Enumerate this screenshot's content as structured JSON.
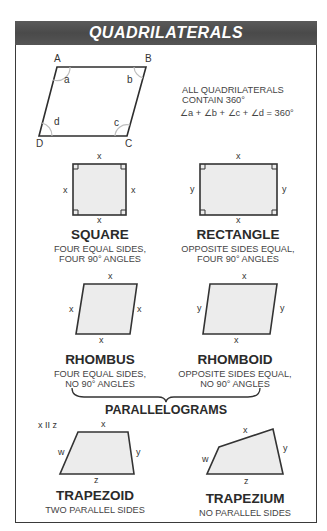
{
  "header": {
    "title": "QUADRILATERALS"
  },
  "general": {
    "vertices": [
      "A",
      "B",
      "C",
      "D"
    ],
    "angles": [
      "a",
      "b",
      "c",
      "d"
    ],
    "note_line1": "ALL QUADRILATERALS",
    "note_line2": "CONTAIN 360°",
    "formula": "∠a + ∠b + ∠c + ∠d = 360°"
  },
  "shapes": {
    "square": {
      "name": "SQUARE",
      "desc1": "FOUR EQUAL SIDES,",
      "desc2": "FOUR 90° ANGLES",
      "sides": {
        "top": "x",
        "bottom": "x",
        "left": "x",
        "right": "x"
      }
    },
    "rectangle": {
      "name": "RECTANGLE",
      "desc1": "OPPOSITE SIDES EQUAL,",
      "desc2": "FOUR 90° ANGLES",
      "sides": {
        "top": "x",
        "bottom": "x",
        "left": "y",
        "right": "y"
      }
    },
    "rhombus": {
      "name": "RHOMBUS",
      "desc1": "FOUR EQUAL SIDES,",
      "desc2": "NO 90° ANGLES",
      "sides": {
        "top": "x",
        "bottom": "x",
        "left": "x",
        "right": "x"
      }
    },
    "rhomboid": {
      "name": "RHOMBOID",
      "desc1": "OPPOSITE SIDES EQUAL,",
      "desc2": "NO 90° ANGLES",
      "sides": {
        "top": "x",
        "bottom": "x",
        "left": "y",
        "right": "y"
      }
    },
    "trapezoid": {
      "name": "TRAPEZOID",
      "desc1": "TWO PARALLEL SIDES",
      "note": "x II z",
      "sides": {
        "top": "x",
        "bottom": "z",
        "left": "w",
        "right": "y"
      }
    },
    "trapezium": {
      "name": "TRAPEZIUM",
      "desc1": "NO PARALLEL SIDES",
      "sides": {
        "top": "x",
        "bottom": "z",
        "left": "w",
        "right": "y"
      }
    }
  },
  "group_label": "PARALLELOGRAMS",
  "colors": {
    "header_bg": "#4f4f4f",
    "shape_fill": "#ececec",
    "stroke": "#333333",
    "arc": "#bdbdbd"
  }
}
